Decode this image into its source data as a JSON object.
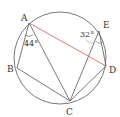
{
  "diagram": {
    "type": "inscribed-polygon-circle",
    "circle": {
      "cx": 60,
      "cy": 58,
      "r": 46
    },
    "points": {
      "A": {
        "x": 29,
        "y": 23,
        "label": "A"
      },
      "B": {
        "x": 17,
        "y": 68,
        "label": "B"
      },
      "C": {
        "x": 70,
        "y": 101,
        "label": "C"
      },
      "D": {
        "x": 106,
        "y": 66,
        "label": "D"
      },
      "E": {
        "x": 99,
        "y": 31,
        "label": "E"
      }
    },
    "angles": {
      "angle_at_A": "44°",
      "angle_at_E": "32°"
    },
    "segments": [
      "AB",
      "BC",
      "AC",
      "CD",
      "CE",
      "ED",
      "AD"
    ],
    "highlight_segment": "AD",
    "colors": {
      "line": "#555555",
      "highlight": "#d9534f"
    }
  }
}
